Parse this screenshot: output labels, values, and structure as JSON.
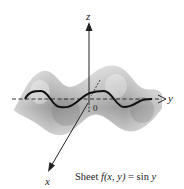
{
  "figure": {
    "caption_prefix": "Sheet ",
    "caption_func": "f",
    "caption_args": "(x, y)",
    "caption_eq": " = sin ",
    "caption_var": "y",
    "caption_full": "Sheet f(x, y) = sin y",
    "axes": {
      "x_label": "x",
      "y_label": "y",
      "z_label": "z",
      "origin_label": "0"
    },
    "colors": {
      "surface_light": "#e6e6e6",
      "surface_mid": "#b4b4b4",
      "surface_dark": "#8a8a8a",
      "curve": "#111111",
      "axis": "#222222"
    }
  }
}
